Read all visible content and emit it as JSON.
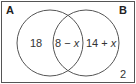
{
  "diagram": {
    "type": "venn",
    "sets": [
      {
        "label": "A",
        "only_region": "18"
      },
      {
        "label": "B",
        "only_region": "14 + x"
      }
    ],
    "intersection": "8 − x",
    "outside": "2",
    "colors": {
      "stroke": "#555555",
      "text": "#222222",
      "background": "#ffffff"
    }
  },
  "labels": {
    "set_a": "A",
    "set_b": "B",
    "a_only": "18",
    "intersection_num": "8 − ",
    "intersection_var": "x",
    "b_only_num": "14 + ",
    "b_only_var": "x",
    "outside": "2"
  }
}
